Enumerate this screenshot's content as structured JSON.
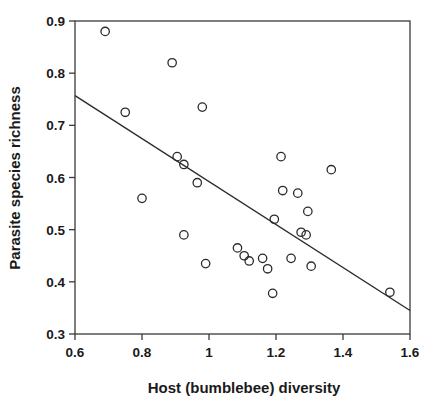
{
  "chart_data": {
    "type": "scatter",
    "title": "",
    "xlabel": "Host (bumblebee) diversity",
    "ylabel": "Parasite species richness",
    "xlim": [
      0.6,
      1.6
    ],
    "ylim": [
      0.3,
      0.9
    ],
    "xticks": [
      0.6,
      0.8,
      1,
      1.2,
      1.4,
      1.6
    ],
    "xtick_labels": [
      "0.6",
      "0.8",
      "1",
      "1.2",
      "1.4",
      "1.6"
    ],
    "yticks": [
      0.3,
      0.4,
      0.5,
      0.6,
      0.7,
      0.8,
      0.9
    ],
    "ytick_labels": [
      "0.3",
      "0.4",
      "0.5",
      "0.6",
      "0.7",
      "0.8",
      "0.9"
    ],
    "grid": false,
    "legend": false,
    "marker": "open-circle",
    "marker_color": "#2b2b2b",
    "points": [
      {
        "x": 0.69,
        "y": 0.88
      },
      {
        "x": 0.75,
        "y": 0.725
      },
      {
        "x": 0.8,
        "y": 0.56
      },
      {
        "x": 0.89,
        "y": 0.82
      },
      {
        "x": 0.905,
        "y": 0.64
      },
      {
        "x": 0.925,
        "y": 0.49
      },
      {
        "x": 0.925,
        "y": 0.625
      },
      {
        "x": 0.965,
        "y": 0.59
      },
      {
        "x": 0.98,
        "y": 0.735
      },
      {
        "x": 0.99,
        "y": 0.435
      },
      {
        "x": 1.085,
        "y": 0.465
      },
      {
        "x": 1.105,
        "y": 0.45
      },
      {
        "x": 1.12,
        "y": 0.44
      },
      {
        "x": 1.16,
        "y": 0.445
      },
      {
        "x": 1.175,
        "y": 0.425
      },
      {
        "x": 1.19,
        "y": 0.378
      },
      {
        "x": 1.195,
        "y": 0.52
      },
      {
        "x": 1.215,
        "y": 0.64
      },
      {
        "x": 1.22,
        "y": 0.575
      },
      {
        "x": 1.245,
        "y": 0.445
      },
      {
        "x": 1.265,
        "y": 0.57
      },
      {
        "x": 1.275,
        "y": 0.495
      },
      {
        "x": 1.29,
        "y": 0.49
      },
      {
        "x": 1.295,
        "y": 0.535
      },
      {
        "x": 1.305,
        "y": 0.43
      },
      {
        "x": 1.365,
        "y": 0.615
      },
      {
        "x": 1.54,
        "y": 0.38
      }
    ],
    "trendline": {
      "name": "regression-line",
      "x_start": 0.6,
      "y_start": 0.757,
      "x_end": 1.6,
      "y_end": 0.345,
      "color": "#2b2b2b"
    }
  }
}
